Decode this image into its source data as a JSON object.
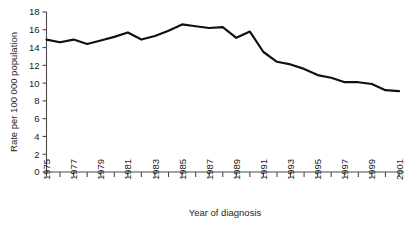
{
  "chart_data": {
    "type": "line",
    "title": "",
    "xlabel": "Year of diagnosis",
    "ylabel": "Rate per 100 000 population",
    "xlim": [
      1975,
      2001
    ],
    "ylim": [
      0,
      18
    ],
    "grid": false,
    "legend": "none",
    "x_tick_step": 1,
    "x_label_step": 2,
    "y_tick_step": 2,
    "y_ticks": [
      0,
      2,
      4,
      6,
      8,
      10,
      12,
      14,
      16,
      18
    ],
    "y_tick_labels": [
      "0",
      "2",
      "4",
      "6",
      "8",
      "10",
      "12",
      "14",
      "16",
      "18"
    ],
    "x_ticks": [
      1975,
      1976,
      1977,
      1978,
      1979,
      1980,
      1981,
      1982,
      1983,
      1984,
      1985,
      1986,
      1987,
      1988,
      1989,
      1990,
      1991,
      1992,
      1993,
      1994,
      1995,
      1996,
      1997,
      1998,
      1999,
      2000,
      2001
    ],
    "x_tick_labels": [
      "1975",
      "",
      "1977",
      "",
      "1979",
      "",
      "1981",
      "",
      "1983",
      "",
      "1985",
      "",
      "1987",
      "",
      "1989",
      "",
      "1991",
      "",
      "1993",
      "",
      "1995",
      "",
      "1997",
      "",
      "1999",
      "",
      "2001"
    ],
    "categories": [
      1975,
      1976,
      1977,
      1978,
      1979,
      1980,
      1981,
      1982,
      1983,
      1984,
      1985,
      1986,
      1987,
      1988,
      1989,
      1990,
      1991,
      1992,
      1993,
      1994,
      1995,
      1996,
      1997,
      1998,
      1999,
      2000,
      2001
    ],
    "values": [
      14.9,
      14.6,
      14.9,
      14.4,
      14.8,
      15.2,
      15.7,
      14.9,
      15.3,
      15.9,
      16.6,
      16.4,
      16.2,
      16.3,
      15.1,
      15.8,
      13.5,
      12.4,
      12.1,
      11.6,
      10.9,
      10.6,
      10.1,
      10.1,
      9.9,
      9.2,
      9.1
    ],
    "line_color": "#111111",
    "axis_color": "#4a4a4a",
    "background_color": "#ffffff"
  }
}
